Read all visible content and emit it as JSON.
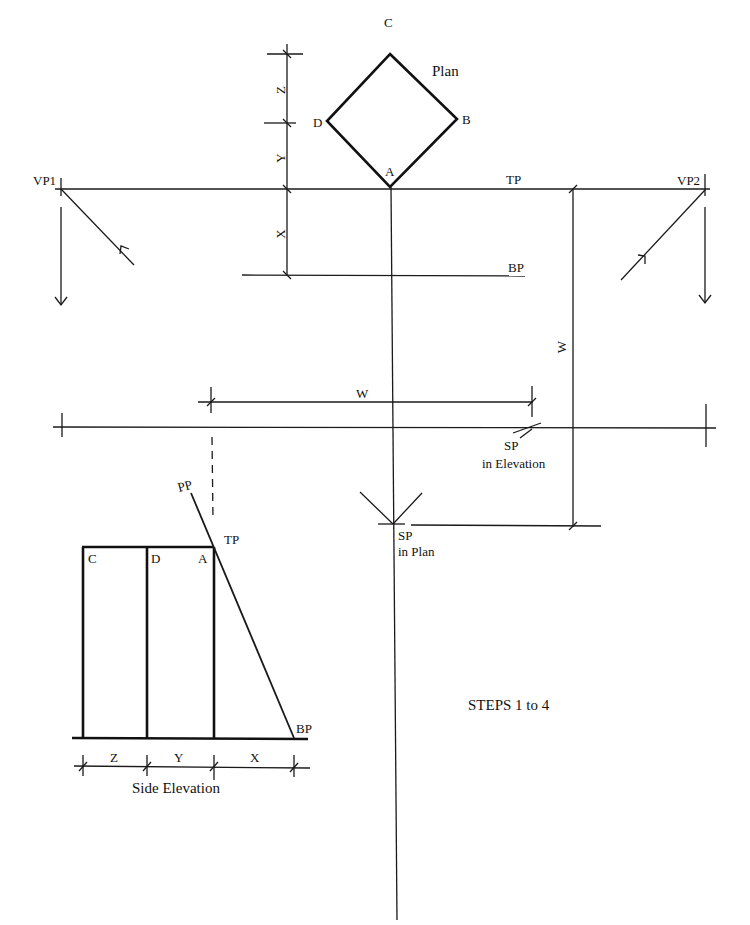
{
  "plan": {
    "title": "Plan",
    "corners": {
      "a": "A",
      "b": "B",
      "c": "C",
      "d": "D"
    }
  },
  "planes": {
    "tp": "TP",
    "bp": "BP",
    "pp": "PP"
  },
  "vanishing_points": {
    "vp1": "VP1",
    "vp2": "VP2"
  },
  "dimensions": {
    "x": "X",
    "y": "Y",
    "z": "Z",
    "w_horizontal": "W",
    "w_vertical": "W"
  },
  "station_point": {
    "elevation_line1": "SP",
    "elevation_line2": "in Elevation",
    "plan_line1": "SP",
    "plan_line2": "in Plan"
  },
  "side_elevation": {
    "title": "Side Elevation",
    "corners": {
      "c": "C",
      "d": "D",
      "a": "A"
    },
    "tp": "TP",
    "bp": "BP",
    "pp": "PP",
    "dims": {
      "z": "Z",
      "y": "Y",
      "x": "X"
    }
  },
  "caption": "STEPS 1 to 4"
}
